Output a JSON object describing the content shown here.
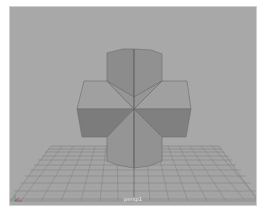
{
  "viewport": {
    "camera_label": "persp1",
    "background_color": "#a8a8a8",
    "axis_icon": "axis-triad-icon"
  },
  "scene": {
    "object": "cross-shaped polygon mesh",
    "grid": "ground plane grid",
    "colors": {
      "face_light": "#9c9c9c",
      "face_mid": "#8f8f8f",
      "face_dark": "#7b7b7b",
      "edge": "#6a6a6a",
      "grid_line": "#7d7d7d"
    }
  }
}
